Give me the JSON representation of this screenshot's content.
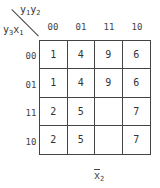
{
  "kmap": {
    "col_var": {
      "base": "y",
      "s1": "1",
      "base2": "y",
      "s2": "2"
    },
    "row_var": {
      "base": "y",
      "s1": "3",
      "base2": "x",
      "s2": "1"
    },
    "col_headers": [
      "00",
      "01",
      "11",
      "10"
    ],
    "row_headers": [
      "00",
      "01",
      "11",
      "10"
    ],
    "cells": [
      [
        "1",
        "4",
        "9",
        "6"
      ],
      [
        "1",
        "4",
        "9",
        "6"
      ],
      [
        "2",
        "5",
        "",
        "7"
      ],
      [
        "2",
        "5",
        "",
        "7"
      ]
    ],
    "bottom_label": {
      "base": "x",
      "sub": "2"
    }
  }
}
